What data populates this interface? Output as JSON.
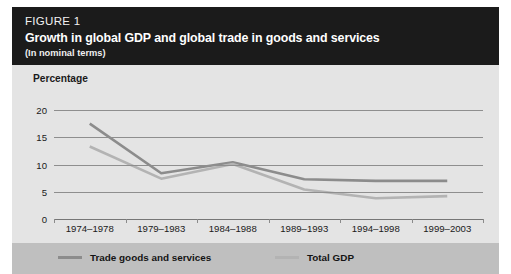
{
  "figure": {
    "label": "FIGURE 1",
    "title": "Growth in global GDP and global trade in goods and services",
    "subtitle": "(In nominal terms)"
  },
  "colors": {
    "header_background": "#1b1b1b",
    "panel_background": "#e4e4e4",
    "legend_background": "#bfbfbf",
    "gridline": "#8e8e8e",
    "trade_series": "#8c8c8c",
    "gdp_series": "#b3b3b3",
    "text": "#1a1a1a"
  },
  "chart_data": {
    "type": "line",
    "title": "Growth in global GDP and global trade in goods and services",
    "subtitle": "(In nominal terms)",
    "xlabel": "",
    "ylabel": "Percentage",
    "ylim": [
      0,
      20
    ],
    "yticks": [
      0,
      5,
      10,
      15,
      20
    ],
    "grid": true,
    "legend_position": "bottom",
    "categories": [
      "1974–1978",
      "1979–1983",
      "1984–1988",
      "1989–1993",
      "1994–1998",
      "1999–2003"
    ],
    "series": [
      {
        "name": "Trade goods and services",
        "color": "#8c8c8c",
        "values": [
          17.5,
          8.4,
          10.4,
          7.3,
          7.0,
          7.0
        ]
      },
      {
        "name": "Total GDP",
        "color": "#b3b3b3",
        "values": [
          13.3,
          7.4,
          10.1,
          5.4,
          3.8,
          4.2
        ]
      }
    ]
  },
  "legend": {
    "items": [
      {
        "label": "Trade goods and services",
        "color": "#8c8c8c"
      },
      {
        "label": "Total GDP",
        "color": "#b3b3b3"
      }
    ]
  }
}
